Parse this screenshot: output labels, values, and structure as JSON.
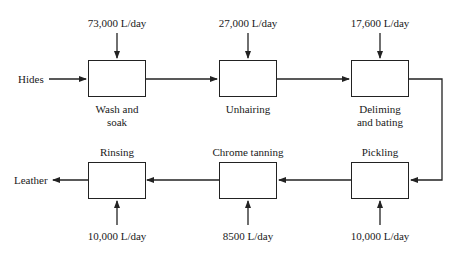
{
  "diagram": {
    "type": "process-flow",
    "input_label": "Hides",
    "output_label": "Leather",
    "processes": [
      {
        "name": "Wash and soak",
        "line1": "Wash and",
        "line2": "soak",
        "water": "73,000 L/day"
      },
      {
        "name": "Unhairing",
        "line1": "Unhairing",
        "water": "27,000 L/day"
      },
      {
        "name": "Deliming and bating",
        "line1": "Deliming",
        "line2": "and bating",
        "water": "17,600 L/day"
      },
      {
        "name": "Pickling",
        "line1": "Pickling",
        "water": "10,000 L/day"
      },
      {
        "name": "Chrome tanning",
        "line1": "Chrome tanning",
        "water": "8500 L/day"
      },
      {
        "name": "Rinsing",
        "line1": "Rinsing",
        "water": "10,000 L/day"
      }
    ],
    "flow_order": [
      "Hides",
      "Wash and soak",
      "Unhairing",
      "Deliming and bating",
      "Pickling",
      "Chrome tanning",
      "Rinsing",
      "Leather"
    ],
    "colors": {
      "line": "#222222",
      "background": "#ffffff"
    }
  }
}
